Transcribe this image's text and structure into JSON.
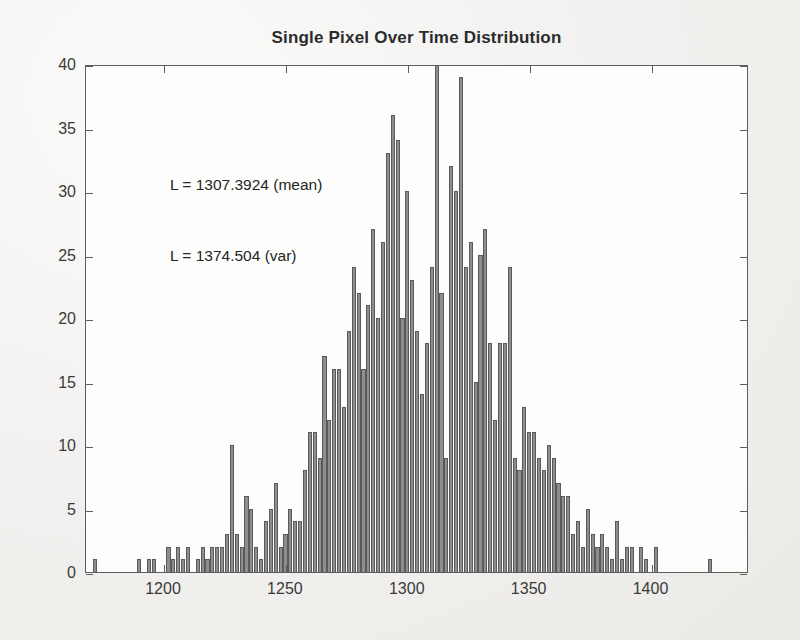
{
  "figure": {
    "title": "Single Pixel Over Time Distribution",
    "annotations": [
      {
        "text": "L = 1307.3924 (mean)"
      },
      {
        "text": "L = 1374.504 (var)"
      }
    ]
  },
  "chart_data": {
    "type": "bar",
    "title": "Single Pixel Over Time Distribution",
    "xlabel": "",
    "ylabel": "",
    "xlim": [
      1168,
      1440
    ],
    "ylim": [
      0,
      40
    ],
    "xticks": [
      1200,
      1250,
      1300,
      1350,
      1400
    ],
    "xticklabels": [
      "1200",
      "1250",
      "1300",
      "1350",
      "1400"
    ],
    "yticks": [
      0,
      5,
      10,
      15,
      20,
      25,
      30,
      35,
      40
    ],
    "yticklabels": [
      "0",
      "5",
      "10",
      "15",
      "20",
      "25",
      "30",
      "35",
      "40"
    ],
    "grid": false,
    "legend": null,
    "bin_width": 2,
    "bar_color": "#8e8e8e",
    "bar_edge_color": "#5a5a5a",
    "statistics": {
      "mean": 1307.3924,
      "variance": 1374.504
    },
    "bins": [
      {
        "x": 1172,
        "value": 1
      },
      {
        "x": 1174,
        "value": 0
      },
      {
        "x": 1176,
        "value": 0
      },
      {
        "x": 1178,
        "value": 0
      },
      {
        "x": 1180,
        "value": 0
      },
      {
        "x": 1182,
        "value": 0
      },
      {
        "x": 1184,
        "value": 0
      },
      {
        "x": 1186,
        "value": 0
      },
      {
        "x": 1188,
        "value": 0
      },
      {
        "x": 1190,
        "value": 1
      },
      {
        "x": 1192,
        "value": 0
      },
      {
        "x": 1194,
        "value": 1
      },
      {
        "x": 1196,
        "value": 1
      },
      {
        "x": 1198,
        "value": 0
      },
      {
        "x": 1200,
        "value": 0
      },
      {
        "x": 1202,
        "value": 2
      },
      {
        "x": 1204,
        "value": 1
      },
      {
        "x": 1206,
        "value": 2
      },
      {
        "x": 1208,
        "value": 1
      },
      {
        "x": 1210,
        "value": 2
      },
      {
        "x": 1212,
        "value": 0
      },
      {
        "x": 1214,
        "value": 1
      },
      {
        "x": 1216,
        "value": 2
      },
      {
        "x": 1218,
        "value": 1
      },
      {
        "x": 1220,
        "value": 2
      },
      {
        "x": 1222,
        "value": 2
      },
      {
        "x": 1224,
        "value": 2
      },
      {
        "x": 1226,
        "value": 3
      },
      {
        "x": 1228,
        "value": 10
      },
      {
        "x": 1230,
        "value": 3
      },
      {
        "x": 1232,
        "value": 2
      },
      {
        "x": 1234,
        "value": 6
      },
      {
        "x": 1236,
        "value": 5
      },
      {
        "x": 1238,
        "value": 2
      },
      {
        "x": 1240,
        "value": 1
      },
      {
        "x": 1242,
        "value": 4
      },
      {
        "x": 1244,
        "value": 5
      },
      {
        "x": 1246,
        "value": 7
      },
      {
        "x": 1248,
        "value": 2
      },
      {
        "x": 1250,
        "value": 3
      },
      {
        "x": 1252,
        "value": 5
      },
      {
        "x": 1254,
        "value": 4
      },
      {
        "x": 1256,
        "value": 4
      },
      {
        "x": 1258,
        "value": 8
      },
      {
        "x": 1260,
        "value": 11
      },
      {
        "x": 1262,
        "value": 11
      },
      {
        "x": 1264,
        "value": 9
      },
      {
        "x": 1266,
        "value": 17
      },
      {
        "x": 1268,
        "value": 12
      },
      {
        "x": 1270,
        "value": 16
      },
      {
        "x": 1272,
        "value": 16
      },
      {
        "x": 1274,
        "value": 13
      },
      {
        "x": 1276,
        "value": 19
      },
      {
        "x": 1278,
        "value": 24
      },
      {
        "x": 1280,
        "value": 22
      },
      {
        "x": 1282,
        "value": 16
      },
      {
        "x": 1284,
        "value": 21
      },
      {
        "x": 1286,
        "value": 27
      },
      {
        "x": 1288,
        "value": 20
      },
      {
        "x": 1290,
        "value": 26
      },
      {
        "x": 1292,
        "value": 33
      },
      {
        "x": 1294,
        "value": 36
      },
      {
        "x": 1296,
        "value": 34
      },
      {
        "x": 1298,
        "value": 20
      },
      {
        "x": 1300,
        "value": 30
      },
      {
        "x": 1302,
        "value": 23
      },
      {
        "x": 1304,
        "value": 19
      },
      {
        "x": 1306,
        "value": 14
      },
      {
        "x": 1308,
        "value": 18
      },
      {
        "x": 1310,
        "value": 24
      },
      {
        "x": 1312,
        "value": 40
      },
      {
        "x": 1314,
        "value": 22
      },
      {
        "x": 1316,
        "value": 9
      },
      {
        "x": 1318,
        "value": 32
      },
      {
        "x": 1320,
        "value": 30
      },
      {
        "x": 1322,
        "value": 39
      },
      {
        "x": 1324,
        "value": 24
      },
      {
        "x": 1326,
        "value": 26
      },
      {
        "x": 1328,
        "value": 15
      },
      {
        "x": 1330,
        "value": 25
      },
      {
        "x": 1332,
        "value": 27
      },
      {
        "x": 1334,
        "value": 18
      },
      {
        "x": 1336,
        "value": 12
      },
      {
        "x": 1338,
        "value": 18
      },
      {
        "x": 1340,
        "value": 18
      },
      {
        "x": 1342,
        "value": 24
      },
      {
        "x": 1344,
        "value": 9
      },
      {
        "x": 1346,
        "value": 8
      },
      {
        "x": 1348,
        "value": 13
      },
      {
        "x": 1350,
        "value": 11
      },
      {
        "x": 1352,
        "value": 11
      },
      {
        "x": 1354,
        "value": 9
      },
      {
        "x": 1356,
        "value": 8
      },
      {
        "x": 1358,
        "value": 10
      },
      {
        "x": 1360,
        "value": 9
      },
      {
        "x": 1362,
        "value": 7
      },
      {
        "x": 1364,
        "value": 6
      },
      {
        "x": 1366,
        "value": 6
      },
      {
        "x": 1368,
        "value": 3
      },
      {
        "x": 1370,
        "value": 4
      },
      {
        "x": 1372,
        "value": 2
      },
      {
        "x": 1374,
        "value": 5
      },
      {
        "x": 1376,
        "value": 3
      },
      {
        "x": 1378,
        "value": 2
      },
      {
        "x": 1380,
        "value": 3
      },
      {
        "x": 1382,
        "value": 2
      },
      {
        "x": 1384,
        "value": 1
      },
      {
        "x": 1386,
        "value": 4
      },
      {
        "x": 1388,
        "value": 1
      },
      {
        "x": 1390,
        "value": 2
      },
      {
        "x": 1392,
        "value": 2
      },
      {
        "x": 1394,
        "value": 0
      },
      {
        "x": 1396,
        "value": 2
      },
      {
        "x": 1398,
        "value": 1
      },
      {
        "x": 1400,
        "value": 0
      },
      {
        "x": 1402,
        "value": 2
      },
      {
        "x": 1404,
        "value": 0
      },
      {
        "x": 1406,
        "value": 0
      },
      {
        "x": 1408,
        "value": 0
      },
      {
        "x": 1410,
        "value": 0
      },
      {
        "x": 1412,
        "value": 0
      },
      {
        "x": 1414,
        "value": 0
      },
      {
        "x": 1416,
        "value": 0
      },
      {
        "x": 1418,
        "value": 0
      },
      {
        "x": 1420,
        "value": 0
      },
      {
        "x": 1422,
        "value": 0
      },
      {
        "x": 1424,
        "value": 1
      },
      {
        "x": 1426,
        "value": 0
      },
      {
        "x": 1428,
        "value": 0
      }
    ]
  }
}
